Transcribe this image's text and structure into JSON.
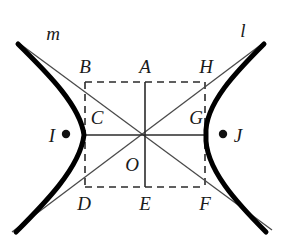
{
  "figure": {
    "width": 282,
    "height": 242,
    "background_color": "#ffffff",
    "ink_color": "#1a1a1a",
    "curve_color": "#000000",
    "thin_line_color": "#4a4a4a",
    "dashed_line_color": "#2b2b2b"
  },
  "point_labels": [
    {
      "id": "B",
      "text": "B",
      "x": 85,
      "y": 66
    },
    {
      "id": "A",
      "text": "A",
      "x": 145,
      "y": 66
    },
    {
      "id": "H",
      "text": "H",
      "x": 206,
      "y": 66
    },
    {
      "id": "C",
      "text": "C",
      "x": 97,
      "y": 117
    },
    {
      "id": "G",
      "text": "G",
      "x": 196,
      "y": 117
    },
    {
      "id": "I",
      "text": "I",
      "x": 52,
      "y": 135
    },
    {
      "id": "J",
      "text": "J",
      "x": 238,
      "y": 135
    },
    {
      "id": "O",
      "text": "O",
      "x": 132,
      "y": 164
    },
    {
      "id": "D",
      "text": "D",
      "x": 84,
      "y": 203
    },
    {
      "id": "E",
      "text": "E",
      "x": 145,
      "y": 203
    },
    {
      "id": "F",
      "text": "F",
      "x": 205,
      "y": 203
    }
  ],
  "line_labels": [
    {
      "id": "m",
      "text": "m",
      "x": 53,
      "y": 33
    },
    {
      "id": "l",
      "text": "l",
      "x": 243,
      "y": 30
    }
  ],
  "focus_markers": [
    {
      "id": "focus-I",
      "label": "I",
      "x": 66,
      "y": 134,
      "r": 4
    },
    {
      "id": "focus-J",
      "label": "J",
      "x": 223,
      "y": 134,
      "r": 4
    }
  ],
  "geometry": {
    "center": {
      "x": 145,
      "y": 135
    },
    "rect": {
      "left": 85,
      "right": 205,
      "top": 82,
      "bottom": 187
    },
    "asymptote_m": {
      "x1": 20,
      "y1": 44,
      "x2": 272,
      "y2": 230
    },
    "asymptote_l": {
      "x1": 262,
      "y1": 44,
      "x2": 12,
      "y2": 232
    },
    "left_branch_path": "M 18 44 C 44 70 80 104 84 135 C 80 168 44 204 16 232",
    "right_branch_path": "M 264 44 C 238 70 204 104 206 135 C 204 168 238 204 266 232",
    "transverse_axis": {
      "x1": 85,
      "y1": 135,
      "x2": 205,
      "y2": 135
    },
    "conjugate_axis_upper": {
      "x1": 145,
      "y1": 82,
      "x2": 145,
      "y2": 135
    },
    "conjugate_axis_lower": {
      "x1": 145,
      "y1": 135,
      "x2": 145,
      "y2": 187
    }
  }
}
